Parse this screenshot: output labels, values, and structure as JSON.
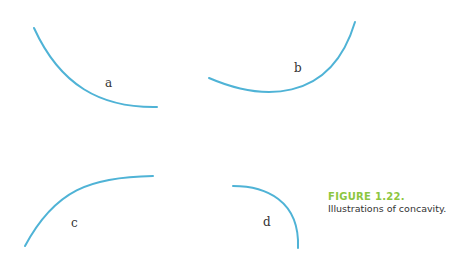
{
  "figure": {
    "number": "FIGURE 1.22.",
    "caption": "Illustrations of concavity.",
    "accent_color": "#8cc63f",
    "curve_color": "#4fb3d6",
    "panels": [
      {
        "label": "a",
        "description": "decreasing, concave up"
      },
      {
        "label": "b",
        "description": "increasing, concave up"
      },
      {
        "label": "c",
        "description": "increasing, concave down"
      },
      {
        "label": "d",
        "description": "decreasing, concave down"
      }
    ]
  }
}
